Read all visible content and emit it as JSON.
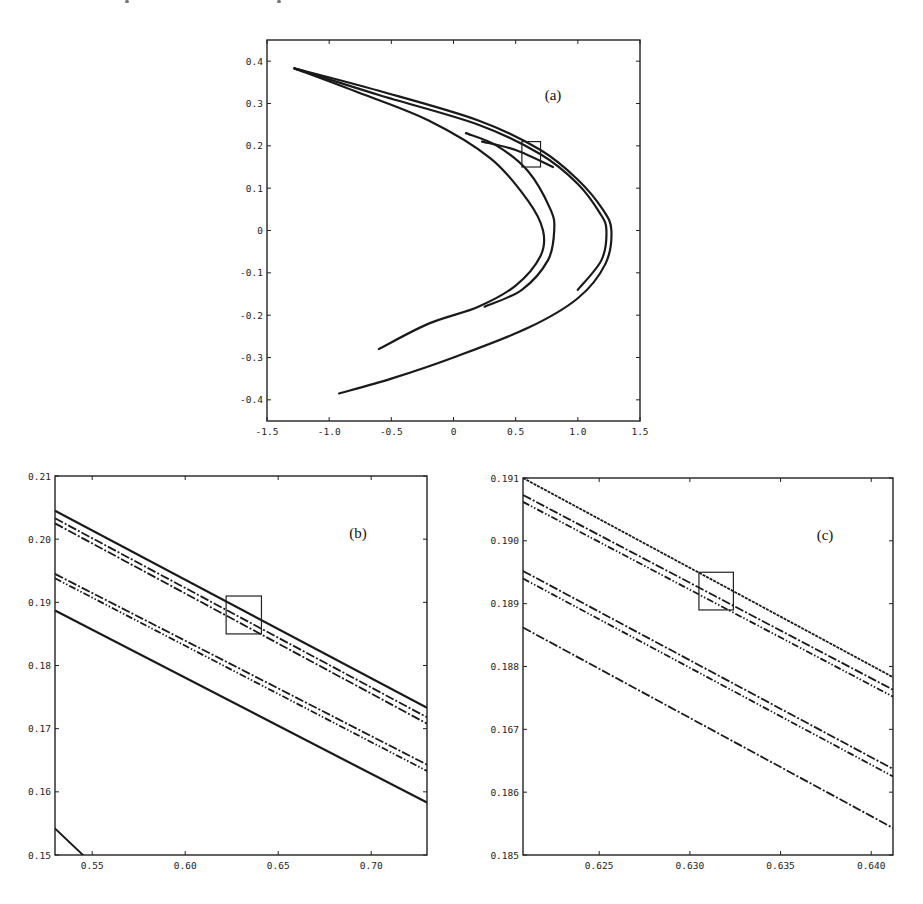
{
  "figure": {
    "panels": [
      "a",
      "b",
      "c"
    ]
  },
  "chart_data": [
    {
      "id": "a",
      "type": "line",
      "title": "",
      "panel_label": "(a)",
      "xlabel": "",
      "ylabel": "",
      "xlim": [
        -1.5,
        1.5
      ],
      "ylim": [
        -0.45,
        0.45
      ],
      "xticks": [
        -1.5,
        -1.0,
        -0.5,
        0,
        0.5,
        1.0,
        1.5
      ],
      "xtick_labels": [
        "-1.5",
        "-1.0",
        "-0.5",
        "0",
        "0.5",
        "1.0",
        "1.5"
      ],
      "yticks": [
        0.4,
        0.3,
        0.2,
        0.1,
        0,
        -0.1,
        -0.2,
        -0.3,
        -0.4
      ],
      "ytick_labels": [
        "0.4",
        "0.3",
        "0.2",
        "0.1",
        "0",
        "-0.1",
        "-0.2",
        "-0.3",
        "-0.4"
      ],
      "grid": false,
      "inset_box": {
        "x": [
          0.55,
          0.7
        ],
        "y": [
          0.15,
          0.21
        ]
      },
      "series": [
        {
          "name": "outer-branch",
          "points": [
            [
              -1.28,
              0.383
            ],
            [
              -0.6,
              0.33
            ],
            [
              0.2,
              0.26
            ],
            [
              0.7,
              0.19
            ],
            [
              1.0,
              0.12
            ],
            [
              1.2,
              0.05
            ],
            [
              1.27,
              0.0
            ],
            [
              1.22,
              -0.08
            ],
            [
              1.0,
              -0.16
            ],
            [
              0.6,
              -0.23
            ],
            [
              0.0,
              -0.3
            ],
            [
              -0.5,
              -0.35
            ],
            [
              -0.92,
              -0.385
            ]
          ]
        },
        {
          "name": "outer-branch-inner",
          "points": [
            [
              -1.28,
              0.383
            ],
            [
              -0.6,
              0.32
            ],
            [
              0.2,
              0.25
            ],
            [
              0.7,
              0.18
            ],
            [
              1.0,
              0.11
            ],
            [
              1.18,
              0.04
            ],
            [
              1.23,
              0.0
            ],
            [
              1.19,
              -0.07
            ],
            [
              1.0,
              -0.14
            ]
          ]
        },
        {
          "name": "inner-fold-1",
          "points": [
            [
              -1.28,
              0.383
            ],
            [
              -0.8,
              0.33
            ],
            [
              -0.2,
              0.26
            ],
            [
              0.3,
              0.17
            ],
            [
              0.6,
              0.07
            ],
            [
              0.72,
              0.0
            ],
            [
              0.7,
              -0.06
            ],
            [
              0.5,
              -0.13
            ],
            [
              0.2,
              -0.18
            ],
            [
              -0.2,
              -0.22
            ],
            [
              -0.6,
              -0.28
            ]
          ]
        },
        {
          "name": "inner-fold-2",
          "points": [
            [
              0.1,
              0.23
            ],
            [
              0.35,
              0.2
            ],
            [
              0.6,
              0.14
            ],
            [
              0.78,
              0.05
            ],
            [
              0.81,
              0.0
            ],
            [
              0.76,
              -0.07
            ],
            [
              0.55,
              -0.14
            ],
            [
              0.25,
              -0.18
            ]
          ]
        },
        {
          "name": "inner-fold-3",
          "points": [
            [
              0.23,
              0.21
            ],
            [
              0.5,
              0.19
            ],
            [
              0.8,
              0.15
            ]
          ]
        }
      ]
    },
    {
      "id": "b",
      "type": "line",
      "title": "",
      "panel_label": "(b)",
      "xlabel": "",
      "ylabel": "",
      "xlim": [
        0.53,
        0.73
      ],
      "ylim": [
        0.15,
        0.21
      ],
      "xticks": [
        0.55,
        0.6,
        0.65,
        0.7
      ],
      "xtick_labels": [
        "0.55",
        "0.60",
        "0.65",
        "0.70"
      ],
      "yticks": [
        0.21,
        0.2,
        0.19,
        0.18,
        0.17,
        0.16,
        0.15
      ],
      "ytick_labels": [
        "0.21",
        "0.20",
        "0.19",
        "0.18",
        "0.17",
        "0.16",
        "0.15"
      ],
      "grid": false,
      "inset_box": {
        "x": [
          0.622,
          0.641
        ],
        "y": [
          0.185,
          0.191
        ]
      },
      "series": [
        {
          "name": "band-1a",
          "style": "solid",
          "y_start": 0.2045,
          "y_end": 0.1733
        },
        {
          "name": "band-1b",
          "style": "dashdot",
          "y_start": 0.2033,
          "y_end": 0.1718
        },
        {
          "name": "band-1c",
          "style": "dashdot",
          "y_start": 0.2025,
          "y_end": 0.1708
        },
        {
          "name": "band-2a",
          "style": "dashdot",
          "y_start": 0.1945,
          "y_end": 0.1643
        },
        {
          "name": "band-2b",
          "style": "dashdotdot",
          "y_start": 0.1938,
          "y_end": 0.1633
        },
        {
          "name": "band-3",
          "style": "solid",
          "y_start": 0.1887,
          "y_end": 0.1583
        },
        {
          "name": "corner-segment",
          "style": "solid",
          "points": [
            [
              0.53,
              0.1542
            ],
            [
              0.545,
              0.15
            ]
          ]
        }
      ]
    },
    {
      "id": "c",
      "type": "line",
      "title": "",
      "panel_label": "(c)",
      "xlabel": "",
      "ylabel": "",
      "xlim": [
        0.6208,
        0.6412
      ],
      "ylim": [
        0.185,
        0.191
      ],
      "xticks": [
        0.625,
        0.63,
        0.635,
        0.64
      ],
      "xtick_labels": [
        "0.625",
        "0.630",
        "0.635",
        "0.640"
      ],
      "yticks": [
        0.191,
        0.19,
        0.189,
        0.188,
        0.187,
        0.186,
        0.185
      ],
      "ytick_labels": [
        "0.191",
        "0.190",
        "0.189",
        "0.188",
        "0.167",
        "0.186",
        "0.185"
      ],
      "grid": false,
      "inset_box": {
        "x": [
          0.6305,
          0.6324
        ],
        "y": [
          0.1889,
          0.1895
        ]
      },
      "series": [
        {
          "name": "band-1a",
          "style": "dotted-dense",
          "y_start": 0.191,
          "y_end": 0.18783
        },
        {
          "name": "band-1b",
          "style": "dashdot",
          "y_start": 0.19073,
          "y_end": 0.18763
        },
        {
          "name": "band-1c",
          "style": "dashdotdot",
          "y_start": 0.19062,
          "y_end": 0.18752
        },
        {
          "name": "band-2a",
          "style": "dashdot",
          "y_start": 0.18952,
          "y_end": 0.18637
        },
        {
          "name": "band-2b",
          "style": "dashdotdot",
          "y_start": 0.1894,
          "y_end": 0.18625
        },
        {
          "name": "band-3",
          "style": "dashdot",
          "y_start": 0.18862,
          "y_end": 0.18543
        }
      ]
    }
  ]
}
